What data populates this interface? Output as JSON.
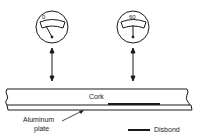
{
  "diagram": {
    "gauges": [
      {
        "id": "left",
        "reading_label": "0",
        "needle": "deflected-left"
      },
      {
        "id": "right",
        "reading_label": "60",
        "needle": "vertical"
      }
    ],
    "layers": {
      "top": "Cork",
      "bottom": "Aluminum plate"
    },
    "labels": {
      "cork": "Cork",
      "aluminum_line1": "Aluminum",
      "aluminum_line2": "plate"
    },
    "legend": {
      "disbond": "Disbond"
    },
    "colors": {
      "ink": "#1a1a1a",
      "background": "#ffffff"
    }
  }
}
